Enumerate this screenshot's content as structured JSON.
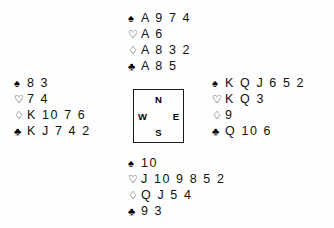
{
  "diagram": {
    "type": "bridge-deal-diagram",
    "suits": {
      "spade": {
        "name": "spade-symbol",
        "glyph": "♠"
      },
      "heart": {
        "name": "heart-symbol",
        "glyph": "♡"
      },
      "diamond": {
        "name": "diamond-symbol",
        "glyph": "♢"
      },
      "club": {
        "name": "club-symbol",
        "glyph": "♣"
      }
    },
    "compass": {
      "north": "N",
      "east": "E",
      "south": "S",
      "west": "W"
    },
    "hands": {
      "north": {
        "position": "North",
        "spades": "A 9 7 4",
        "hearts": "A 6",
        "diamonds": "A 8 3 2",
        "clubs": "A 8 5"
      },
      "west": {
        "position": "West",
        "spades": "8 3",
        "hearts": "7 4",
        "diamonds": "K 10 7 6",
        "clubs": "K J 7 4 2"
      },
      "east": {
        "position": "East",
        "spades": "K Q J 6 5 2",
        "hearts": "K Q 3",
        "diamonds": "9",
        "clubs": "Q 10 6"
      },
      "south": {
        "position": "South",
        "spades": "10",
        "hearts": "J 10 9 8 5 2",
        "diamonds": "Q J 5 4",
        "clubs": "9 3"
      }
    }
  }
}
